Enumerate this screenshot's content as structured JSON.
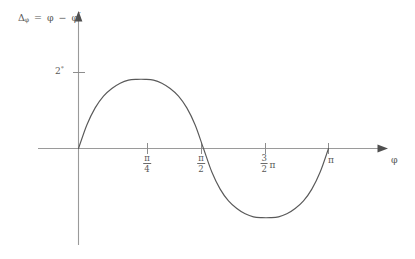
{
  "chart_data": {
    "type": "line",
    "title": "",
    "subtitle": "",
    "ylabel": "Δφ = φ − φ′",
    "ylabel_parts": {
      "delta": "Δ",
      "subscript": "φ",
      "equals": "=",
      "phi": "φ",
      "minus": "−",
      "phi_prime": "φ",
      "prime": "′"
    },
    "xlabel": "φ",
    "y_ticks": [
      {
        "value": 2,
        "label": "2",
        "unit": "°"
      }
    ],
    "x_ticks": [
      {
        "value": 0.7853981634,
        "label_num": "π",
        "label_den": "4",
        "label": "π/4",
        "style": "fraction"
      },
      {
        "value": 1.5707963268,
        "label_num": "π",
        "label_den": "2",
        "label": "π/2",
        "style": "fraction"
      },
      {
        "value": 2.3561944902,
        "label_num": "3",
        "label_den": "2",
        "label_suffix": "π",
        "label": "3/2 π",
        "style": "fraction-with-suffix"
      },
      {
        "value": 3.1415926536,
        "label": "π",
        "style": "plain"
      }
    ],
    "xlim": [
      0,
      3.4
    ],
    "ylim": [
      -2.45,
      2.9
    ],
    "grid": false,
    "legend": null,
    "series": [
      {
        "name": "phase-error",
        "comment": "Approximately A*sin(2*phi) with A slightly below the 2-degree tick; zero at 0, pi/2 and pi.",
        "amplitude": 1.82,
        "x": [
          0.0,
          0.1047,
          0.2094,
          0.3142,
          0.4189,
          0.5236,
          0.6283,
          0.733,
          0.8378,
          0.9425,
          1.0472,
          1.1519,
          1.2566,
          1.3614,
          1.4661,
          1.5708,
          1.6755,
          1.7802,
          1.885,
          1.9897,
          2.0944,
          2.1991,
          2.3038,
          2.4086,
          2.5133,
          2.618,
          2.7227,
          2.8274,
          2.9322,
          3.0369,
          3.1416
        ],
        "y": [
          0.0,
          0.62,
          1.07,
          1.38,
          1.58,
          1.72,
          1.8,
          1.82,
          1.82,
          1.8,
          1.72,
          1.58,
          1.38,
          1.07,
          0.62,
          0.0,
          -0.62,
          -1.07,
          -1.38,
          -1.58,
          -1.72,
          -1.8,
          -1.82,
          -1.82,
          -1.8,
          -1.72,
          -1.58,
          -1.38,
          -1.07,
          -0.62,
          0.0
        ]
      }
    ]
  },
  "axes": {
    "x_axis_name": "phi-axis",
    "y_axis_name": "delta-phi-axis",
    "arrow_x": "right",
    "arrow_y": "up"
  },
  "colors": {
    "curve": "#595959",
    "axis": "#8d8d8d",
    "text": "#585858",
    "background": "#ffffff"
  }
}
